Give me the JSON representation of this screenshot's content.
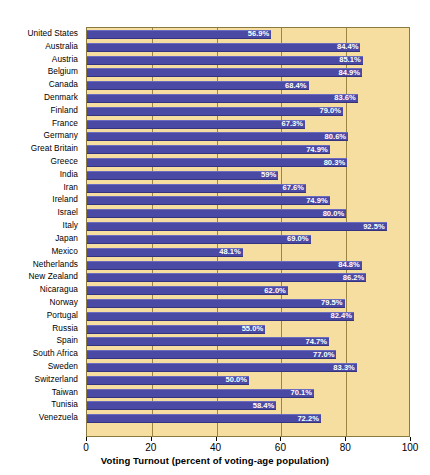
{
  "chart_data": {
    "type": "bar",
    "orientation": "horizontal",
    "title": "",
    "xlabel": "Voting Turnout (percent of voting-age population)",
    "ylabel": "",
    "xlim": [
      0,
      100
    ],
    "xticks": [
      0,
      20,
      40,
      60,
      80,
      100
    ],
    "xtick_labels": [
      "0",
      "20",
      "40",
      "60",
      "80",
      "100"
    ],
    "grid": true,
    "grid_axis": "x",
    "legend": "none",
    "bar_color": "#4a4aa5",
    "plot_background": "#f6dda0",
    "gridline_color": "#9a8640",
    "value_label_color": "#ffffff",
    "categories": [
      "United States",
      "Australia",
      "Austria",
      "Belgium",
      "Canada",
      "Denmark",
      "Finland",
      "France",
      "Germany",
      "Great Britain",
      "Greece",
      "India",
      "Iran",
      "Ireland",
      "Israel",
      "Italy",
      "Japan",
      "Mexico",
      "Netherlands",
      "New Zealand",
      "Nicaragua",
      "Norway",
      "Portugal",
      "Russia",
      "Spain",
      "South Africa",
      "Sweden",
      "Switzerland",
      "Taiwan",
      "Tunisia",
      "Venezuela"
    ],
    "values": [
      56.9,
      84.4,
      85.1,
      84.9,
      68.4,
      83.6,
      79.0,
      67.3,
      80.6,
      74.9,
      80.3,
      59.0,
      67.6,
      74.9,
      80.0,
      92.5,
      69.0,
      48.1,
      84.8,
      86.2,
      62.0,
      79.5,
      82.4,
      55.0,
      74.7,
      77.0,
      83.3,
      50.0,
      70.1,
      58.4,
      72.2
    ],
    "value_labels": [
      "56.9%",
      "84.4%",
      "85.1%",
      "84.9%",
      "68.4%",
      "83.6%",
      "79.0%",
      "67.3%",
      "80.6%",
      "74.9%",
      "80.3%",
      "59%",
      "67.6%",
      "74.9%",
      "80.0%",
      "92.5%",
      "69.0%",
      "48.1%",
      "84.8%",
      "86.2%",
      "62.0%",
      "79.5%",
      "82.4%",
      "55.0%",
      "74.7%",
      "77.0%",
      "83.3%",
      "50.0%",
      "70.1%",
      "58.4%",
      "72.2%"
    ]
  }
}
